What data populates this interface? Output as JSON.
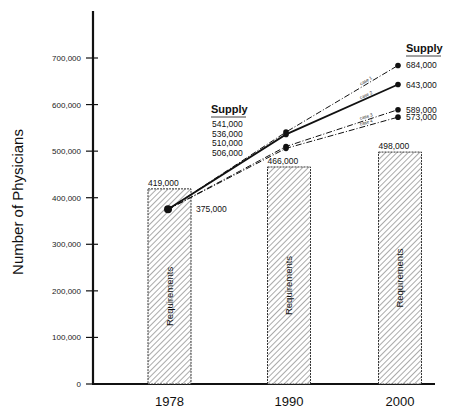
{
  "chart_data": {
    "type": "bar+line",
    "title": "",
    "xlabel": "",
    "ylabel": "Number of Physicians",
    "ylim": [
      0,
      700000
    ],
    "yticks": [
      0,
      100000,
      200000,
      300000,
      400000,
      500000,
      600000,
      700000
    ],
    "ytick_labels": [
      "0",
      "100,000",
      "200,000",
      "300,000",
      "400,000",
      "500,000",
      "600,000",
      "700,000"
    ],
    "grid": false,
    "categories": [
      "1978",
      "1990",
      "2000"
    ],
    "bars": {
      "name": "Requirements",
      "values": [
        419000,
        466000,
        498000
      ],
      "value_labels": [
        "419,000",
        "466,000",
        "498,000"
      ],
      "pattern": "diagonal-hatch"
    },
    "series": [
      {
        "name": "case 1",
        "style": "dash-dot",
        "x": [
          "1978",
          "1990",
          "2000"
        ],
        "values": [
          375000,
          541000,
          684000
        ]
      },
      {
        "name": "case 2",
        "style": "solid",
        "x": [
          "1978",
          "1990",
          "2000"
        ],
        "values": [
          375000,
          536000,
          643000
        ]
      },
      {
        "name": "case 3",
        "style": "dash-dot",
        "x": [
          "1978",
          "1990",
          "2000"
        ],
        "values": [
          375000,
          510000,
          589000
        ]
      },
      {
        "name": "case 4",
        "style": "dash-dot",
        "x": [
          "1978",
          "1990",
          "2000"
        ],
        "values": [
          375000,
          506000,
          573000
        ]
      }
    ],
    "annotations": {
      "start_value": "375,000",
      "supply_label_1990": "Supply",
      "supply_values_1990": [
        "541,000",
        "536,000",
        "510,000",
        "506,000"
      ],
      "supply_label_2000": "Supply",
      "supply_values_2000": [
        "684,000",
        "643,000",
        "589,000",
        "573,000"
      ]
    }
  }
}
